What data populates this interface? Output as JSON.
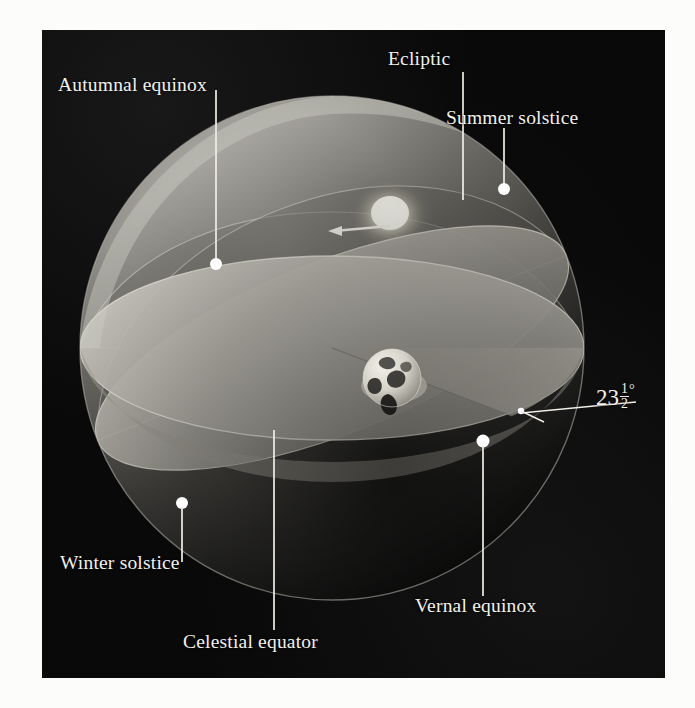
{
  "figure": {
    "background_color": "#0a0a0a",
    "label_color": "#f2f0ea",
    "marker_color": "#ffffff",
    "plane_color": "#b9b7ae",
    "sphere_color": "#8e8c86"
  },
  "labels": {
    "ecliptic": "Ecliptic",
    "summer_solstice": "Summer solstice",
    "autumnal_equinox": "Autumnal equinox",
    "winter_solstice": "Winter solstice",
    "celestial_equator": "Celestial equator",
    "vernal_equinox": "Vernal equinox"
  },
  "angle": {
    "whole": "23",
    "numerator": "1",
    "denominator": "2",
    "degree_symbol": "°",
    "full_text": "23 1/2 degrees"
  },
  "objects": {
    "earth": "earth-globe",
    "sun": "sun-glow",
    "motion_arrow": "ecliptic-motion-arrow"
  },
  "markers": [
    {
      "name": "summer-solstice-marker",
      "label": "Summer solstice"
    },
    {
      "name": "autumnal-equinox-marker",
      "label": "Autumnal equinox"
    },
    {
      "name": "vernal-equinox-marker",
      "label": "Vernal equinox"
    },
    {
      "name": "winter-solstice-marker",
      "label": "Winter solstice"
    },
    {
      "name": "tilt-vertex-marker",
      "label": "23 1/2 degrees"
    }
  ]
}
